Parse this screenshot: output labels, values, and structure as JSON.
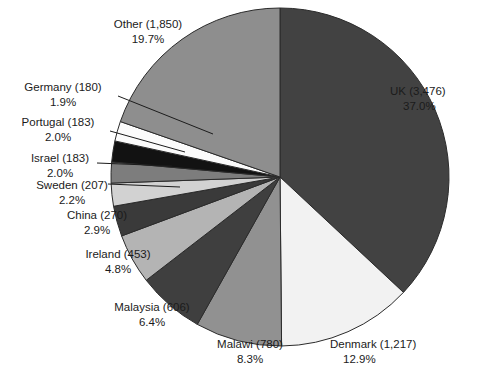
{
  "chart_data": {
    "type": "pie",
    "title": "",
    "subtitle": "",
    "xlabel": "",
    "ylabel": "",
    "legend_position": "none",
    "grid": false,
    "label_format": "{name} ({value})\n{percent}%",
    "start_angle_deg": 0,
    "direction": "clockwise",
    "total": 9405,
    "categories": [
      "UK",
      "Denmark",
      "Malawi",
      "Malaysia",
      "Ireland",
      "China",
      "Sweden",
      "Israel",
      "Portugal",
      "Germany",
      "Other"
    ],
    "values": [
      3476,
      1217,
      780,
      606,
      453,
      270,
      207,
      183,
      183,
      180,
      1850
    ],
    "percents": [
      37.0,
      12.9,
      8.3,
      6.4,
      4.8,
      2.9,
      2.2,
      2.0,
      2.0,
      1.9,
      19.7
    ],
    "value_labels": [
      "3,476",
      "1,217",
      "780",
      "606",
      "453",
      "270",
      "207",
      "183",
      "183",
      "180",
      "1,850"
    ],
    "slices": [
      {
        "name": "UK",
        "value": 3476,
        "value_label": "3,476",
        "percent": 37.0,
        "percent_label": "37.0%",
        "name_line": "UK (3,476)",
        "color": "#424242",
        "label_x": 390,
        "label_y": 95,
        "label_anchor": "start",
        "leader": false
      },
      {
        "name": "Denmark",
        "value": 1217,
        "value_label": "1,217",
        "percent": 12.9,
        "percent_label": "12.9%",
        "name_line": "Denmark (1,217)",
        "color": "#f2f2f2",
        "label_x": 330,
        "label_y": 348,
        "label_anchor": "start",
        "leader": false
      },
      {
        "name": "Malawi",
        "value": 780,
        "value_label": "780",
        "percent": 8.3,
        "percent_label": "8.3%",
        "name_line": "Malawi (780)",
        "color": "#919191",
        "label_x": 250,
        "label_y": 348,
        "label_anchor": "middle",
        "leader": false
      },
      {
        "name": "Malaysia",
        "value": 606,
        "value_label": "606",
        "percent": 6.4,
        "percent_label": "6.4%",
        "name_line": "Malaysia (606)",
        "color": "#3f3f3f",
        "label_x": 152,
        "label_y": 311,
        "label_anchor": "middle",
        "leader": false
      },
      {
        "name": "Ireland",
        "value": 453,
        "value_label": "453",
        "percent": 4.8,
        "percent_label": "4.8%",
        "name_line": "Ireland (453)",
        "color": "#b4b4b4",
        "label_x": 118,
        "label_y": 258,
        "label_anchor": "middle",
        "leader": false
      },
      {
        "name": "China",
        "value": 270,
        "value_label": "270",
        "percent": 2.9,
        "percent_label": "2.9%",
        "name_line": "China (270)",
        "color": "#3a3a3a",
        "label_x": 97,
        "label_y": 219,
        "label_anchor": "middle",
        "leader": false
      },
      {
        "name": "Sweden",
        "value": 207,
        "value_label": "207",
        "percent": 2.2,
        "percent_label": "2.2%",
        "name_line": "Sweden (207)",
        "color": "#d2d2d2",
        "label_x": 72,
        "label_y": 189,
        "label_anchor": "middle",
        "leader": true
      },
      {
        "name": "Israel",
        "value": 183,
        "value_label": "183",
        "percent": 2.0,
        "percent_label": "2.0%",
        "name_line": "Israel (183)",
        "color": "#7d7d7d",
        "label_x": 60,
        "label_y": 162,
        "label_anchor": "middle",
        "leader": true
      },
      {
        "name": "Portugal",
        "value": 183,
        "value_label": "183",
        "percent": 2.0,
        "percent_label": "2.0%",
        "name_line": "Portugal (183)",
        "color": "#121212",
        "label_x": 58,
        "label_y": 126,
        "label_anchor": "middle",
        "leader": true
      },
      {
        "name": "Germany",
        "value": 180,
        "value_label": "180",
        "percent": 1.9,
        "percent_label": "1.9%",
        "name_line": "Germany (180)",
        "color": "#fbfbfb",
        "label_x": 63,
        "label_y": 91,
        "label_anchor": "middle",
        "leader": true
      },
      {
        "name": "Other",
        "value": 1850,
        "value_label": "1,850",
        "percent": 19.7,
        "percent_label": "19.7%",
        "name_line": "Other (1,850)",
        "color": "#8e8e8e",
        "label_x": 148,
        "label_y": 28,
        "label_anchor": "middle",
        "leader": false
      }
    ],
    "geometry": {
      "center_x": 280,
      "center_y": 177,
      "radius": 169,
      "outline_color": "#2b2b2b",
      "outline_width": 1
    },
    "leader_lines": [
      {
        "name": "germany-leader",
        "x1": 118,
        "y1": 96,
        "x2": 213,
        "y2": 134
      },
      {
        "name": "portugal-leader",
        "x1": 110,
        "y1": 131,
        "x2": 185,
        "y2": 152
      },
      {
        "name": "israel-leader",
        "x1": 97,
        "y1": 163,
        "x2": 172,
        "y2": 166
      },
      {
        "name": "sweden-leader",
        "x1": 108,
        "y1": 184,
        "x2": 180,
        "y2": 187
      }
    ]
  }
}
